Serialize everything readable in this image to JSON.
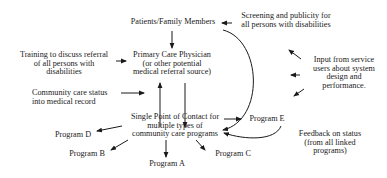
{
  "diagram": {
    "nodes": {
      "patients": {
        "lines": [
          "Patients/Family Members"
        ]
      },
      "physician": {
        "lines": [
          "Primary Care Physician",
          "(or other potential",
          "medical referral source)"
        ]
      },
      "spoc": {
        "lines": [
          "Single Point of Contact for",
          "multiple types of",
          "community care programs"
        ]
      },
      "program_a": {
        "lines": [
          "Program A"
        ]
      },
      "program_b": {
        "lines": [
          "Program B"
        ]
      },
      "program_c": {
        "lines": [
          "Program C"
        ]
      },
      "program_d": {
        "lines": [
          "Program D"
        ]
      },
      "program_e": {
        "lines": [
          "Program E"
        ]
      }
    },
    "annotations": {
      "screening": {
        "lines": [
          "Screening and publicity for",
          "all persons with disabilities"
        ]
      },
      "training": {
        "lines": [
          "Training to discuss referral",
          "of all persons with",
          "disabilities"
        ]
      },
      "community_status": {
        "lines": [
          "Community care status",
          "into medical record"
        ]
      },
      "input": {
        "lines": [
          "Input from service",
          "users about system",
          "design and",
          "performance."
        ]
      },
      "feedback": {
        "lines": [
          "Feedback on status",
          "(from all linked",
          "programs)"
        ]
      }
    },
    "edges": [
      {
        "from": "patients",
        "to": "physician"
      },
      {
        "from": "patients",
        "to": "spoc",
        "style": "curved"
      },
      {
        "from": "physician",
        "to": "spoc"
      },
      {
        "from": "spoc",
        "to": "physician"
      },
      {
        "from": "screening",
        "to": "patients"
      },
      {
        "from": "training",
        "to": "physician"
      },
      {
        "from": "community_status",
        "to": "physician"
      },
      {
        "from": "spoc",
        "to": "program_a"
      },
      {
        "from": "spoc",
        "to": "program_b"
      },
      {
        "from": "spoc",
        "to": "program_c"
      },
      {
        "from": "spoc",
        "to": "program_d"
      },
      {
        "from": "spoc",
        "to": "program_e"
      },
      {
        "from": "program_e",
        "to": "spoc",
        "style": "curved",
        "label": "feedback"
      },
      {
        "from": "input",
        "to": "system",
        "count": 3
      }
    ]
  }
}
